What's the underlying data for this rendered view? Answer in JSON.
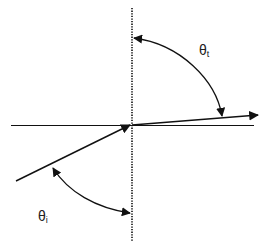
{
  "diagram": {
    "type": "refraction-angles",
    "colors": {
      "background": "#ffffff",
      "stroke": "#111111",
      "label": "#222222"
    },
    "labels": {
      "theta_t": {
        "symbol": "θ",
        "subscript": "t"
      },
      "theta_i": {
        "symbol": "θ",
        "subscript": "i"
      }
    },
    "elements": {
      "normal_line": {
        "style": "dotted",
        "orientation": "vertical"
      },
      "interface_line": {
        "style": "solid",
        "orientation": "horizontal"
      },
      "incident_ray": {
        "direction": "toward-origin"
      },
      "refracted_ray": {
        "direction": "away-from-origin"
      },
      "transmission_angle_arc": {
        "double_headed": true
      },
      "incidence_angle_arc": {
        "double_headed": true
      }
    }
  }
}
